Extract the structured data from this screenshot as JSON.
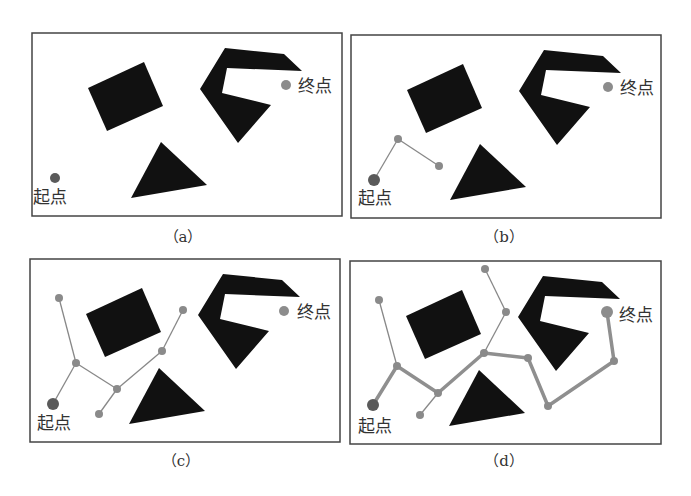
{
  "figure": {
    "colors": {
      "background": "#ffffff",
      "border": "#444444",
      "obstacle": "#111111",
      "start_point": "#5a5a5a",
      "goal_point": "#8c8c8c",
      "tree_node": "#8a8a8a",
      "tree_edge": "#888888",
      "path_edge": "#8f8f8f",
      "label_text": "#333333"
    },
    "labels": {
      "start": "起点",
      "goal": "终点"
    },
    "panels": [
      {
        "id": "a",
        "caption": "（a）",
        "box": {
          "x": 32,
          "y": 33,
          "w": 310,
          "h": 183
        },
        "caption_pos": {
          "x": 183,
          "y": 242
        },
        "start": {
          "x": 55,
          "y": 178,
          "r": 5
        },
        "goal": {
          "x": 286,
          "y": 85,
          "r": 5
        },
        "start_label_pos": {
          "x": 33,
          "y": 203
        },
        "goal_label_pos": {
          "x": 298,
          "y": 92
        },
        "tree_nodes": [],
        "tree_edges": [],
        "path_edges": []
      },
      {
        "id": "b",
        "caption": "（b）",
        "box": {
          "x": 351,
          "y": 35,
          "w": 310,
          "h": 183
        },
        "caption_pos": {
          "x": 504,
          "y": 242
        },
        "start": {
          "x": 374,
          "y": 180,
          "r": 6
        },
        "goal": {
          "x": 608,
          "y": 87,
          "r": 5
        },
        "start_label_pos": {
          "x": 358,
          "y": 204
        },
        "goal_label_pos": {
          "x": 620,
          "y": 94
        },
        "tree_nodes": [
          {
            "x": 398,
            "y": 139
          },
          {
            "x": 439,
            "y": 166
          }
        ],
        "tree_edges": [
          [
            374,
            180,
            398,
            139
          ],
          [
            398,
            139,
            439,
            166
          ]
        ],
        "path_edges": []
      },
      {
        "id": "c",
        "caption": "（c）",
        "box": {
          "x": 30,
          "y": 259,
          "w": 310,
          "h": 183
        },
        "caption_pos": {
          "x": 181,
          "y": 466
        },
        "start": {
          "x": 53,
          "y": 404,
          "r": 6
        },
        "goal": {
          "x": 284,
          "y": 311,
          "r": 5
        },
        "start_label_pos": {
          "x": 37,
          "y": 429
        },
        "goal_label_pos": {
          "x": 297,
          "y": 318
        },
        "tree_nodes": [
          {
            "x": 59,
            "y": 298
          },
          {
            "x": 76,
            "y": 363
          },
          {
            "x": 117,
            "y": 389
          },
          {
            "x": 99,
            "y": 414
          },
          {
            "x": 162,
            "y": 351
          },
          {
            "x": 183,
            "y": 310
          }
        ],
        "tree_edges": [
          [
            53,
            404,
            76,
            363
          ],
          [
            76,
            363,
            59,
            298
          ],
          [
            76,
            363,
            117,
            389
          ],
          [
            117,
            389,
            99,
            414
          ],
          [
            117,
            389,
            162,
            351
          ],
          [
            162,
            351,
            183,
            310
          ]
        ],
        "path_edges": []
      },
      {
        "id": "d",
        "caption": "（d）",
        "box": {
          "x": 350,
          "y": 261,
          "w": 311,
          "h": 183
        },
        "caption_pos": {
          "x": 504,
          "y": 466
        },
        "start": {
          "x": 373,
          "y": 405,
          "r": 6
        },
        "goal": {
          "x": 607,
          "y": 312,
          "r": 6
        },
        "start_label_pos": {
          "x": 358,
          "y": 432
        },
        "goal_label_pos": {
          "x": 619,
          "y": 321
        },
        "tree_nodes": [
          {
            "x": 379,
            "y": 300
          },
          {
            "x": 397,
            "y": 366
          },
          {
            "x": 438,
            "y": 393
          },
          {
            "x": 420,
            "y": 415
          },
          {
            "x": 484,
            "y": 353
          },
          {
            "x": 506,
            "y": 312
          },
          {
            "x": 485,
            "y": 269
          },
          {
            "x": 528,
            "y": 358
          },
          {
            "x": 548,
            "y": 406
          },
          {
            "x": 614,
            "y": 361
          }
        ],
        "tree_edges": [
          [
            397,
            366,
            379,
            300
          ],
          [
            438,
            393,
            420,
            415
          ],
          [
            484,
            353,
            506,
            312
          ],
          [
            506,
            312,
            485,
            269
          ]
        ],
        "path_edges": [
          [
            373,
            405,
            397,
            366
          ],
          [
            397,
            366,
            438,
            393
          ],
          [
            438,
            393,
            484,
            353
          ],
          [
            484,
            353,
            528,
            358
          ],
          [
            528,
            358,
            548,
            406
          ],
          [
            548,
            406,
            614,
            361
          ],
          [
            614,
            361,
            607,
            312
          ]
        ]
      }
    ]
  }
}
